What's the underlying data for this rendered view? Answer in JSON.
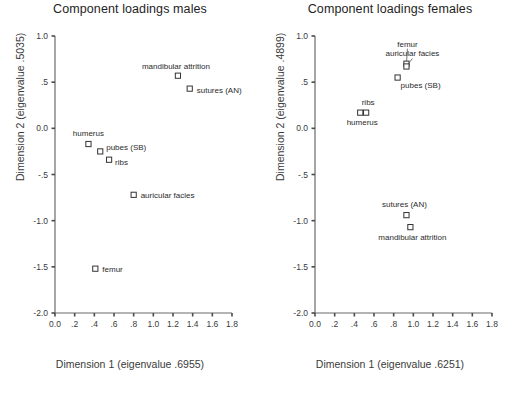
{
  "chart_data": [
    {
      "type": "scatter",
      "title": "Component loadings males",
      "xlabel": "Dimension 1 (eigenvalue  .6955)",
      "ylabel": "Dimension 2 (eigenvalue  .5035)",
      "xlim": [
        0.0,
        1.8
      ],
      "ylim": [
        -2.0,
        1.0
      ],
      "xticks": [
        "0.0",
        ".2",
        ".4",
        ".6",
        ".8",
        "1.0",
        "1.2",
        "1.4",
        "1.6",
        "1.8"
      ],
      "xtick_values": [
        0.0,
        0.2,
        0.4,
        0.6,
        0.8,
        1.0,
        1.2,
        1.4,
        1.6,
        1.8
      ],
      "yticks": [
        "1.0",
        ".5",
        "0.0",
        "-.5",
        "-1.0",
        "-1.5",
        "-2.0"
      ],
      "ytick_values": [
        1.0,
        0.5,
        0.0,
        -0.5,
        -1.0,
        -1.5,
        -2.0
      ],
      "grid": false,
      "legend": "none",
      "marker": "open-square",
      "points": [
        {
          "label": "mandibular attrition",
          "x": 1.25,
          "y": 0.57,
          "label_dx": -2,
          "label_dy": -7,
          "label_anchor": "middle"
        },
        {
          "label": "sutures (AN)",
          "x": 1.37,
          "y": 0.43,
          "label_dx": 7,
          "label_dy": 4,
          "label_anchor": "start"
        },
        {
          "label": "humerus",
          "x": 0.34,
          "y": -0.17,
          "label_dx": 0,
          "label_dy": -8,
          "label_anchor": "middle"
        },
        {
          "label": "pubes (SB)",
          "x": 0.46,
          "y": -0.25,
          "label_dx": 6,
          "label_dy": -1,
          "label_anchor": "start"
        },
        {
          "label": "ribs",
          "x": 0.55,
          "y": -0.34,
          "label_dx": 6,
          "label_dy": 5,
          "label_anchor": "start"
        },
        {
          "label": "auricular facies",
          "x": 0.8,
          "y": -0.72,
          "label_dx": 7,
          "label_dy": 3,
          "label_anchor": "start"
        },
        {
          "label": "femur",
          "x": 0.41,
          "y": -1.52,
          "label_dx": 7,
          "label_dy": 3,
          "label_anchor": "start"
        }
      ]
    },
    {
      "type": "scatter",
      "title": "Component loadings females",
      "xlabel": "Dimension 1 (eigenvalue  .6251)",
      "ylabel": "Dimension 2 (eigenvalue  .4899)",
      "xlim": [
        0.0,
        1.8
      ],
      "ylim": [
        -2.0,
        1.0
      ],
      "xticks": [
        "0.0",
        ".2",
        ".4",
        ".6",
        ".8",
        "1.0",
        "1.2",
        "1.4",
        "1.6",
        "1.8"
      ],
      "xtick_values": [
        0.0,
        0.2,
        0.4,
        0.6,
        0.8,
        1.0,
        1.2,
        1.4,
        1.6,
        1.8
      ],
      "yticks": [
        "1.0",
        ".5",
        "0.0",
        "-.5",
        "-1.0",
        "-1.5",
        "-2.0"
      ],
      "ytick_values": [
        1.0,
        0.5,
        0.0,
        -0.5,
        -1.0,
        -1.5,
        -2.0
      ],
      "grid": false,
      "legend": "none",
      "marker": "open-square",
      "points": [
        {
          "label": "femur",
          "x": 0.93,
          "y": 0.7,
          "label_dx": 1,
          "label_dy": -17,
          "label_anchor": "middle",
          "leader": true
        },
        {
          "label": "auricular facies",
          "x": 0.93,
          "y": 0.67,
          "label_dx": 6,
          "label_dy": -10,
          "label_anchor": "middle",
          "leader": true
        },
        {
          "label": "pubes (SB)",
          "x": 0.84,
          "y": 0.55,
          "label_dx": 3,
          "label_dy": 10,
          "label_anchor": "start"
        },
        {
          "label": "ribs",
          "x": 0.52,
          "y": 0.17,
          "label_dx": 2,
          "label_dy": -8,
          "label_anchor": "middle"
        },
        {
          "label": "humerus",
          "x": 0.46,
          "y": 0.17,
          "label_dx": 2,
          "label_dy": 12,
          "label_anchor": "middle"
        },
        {
          "label": "sutures (AN)",
          "x": 0.93,
          "y": -0.94,
          "label_dx": -2,
          "label_dy": -8,
          "label_anchor": "middle"
        },
        {
          "label": "mandibular attrition",
          "x": 0.97,
          "y": -1.07,
          "label_dx": 2,
          "label_dy": 13,
          "label_anchor": "middle"
        }
      ]
    }
  ]
}
